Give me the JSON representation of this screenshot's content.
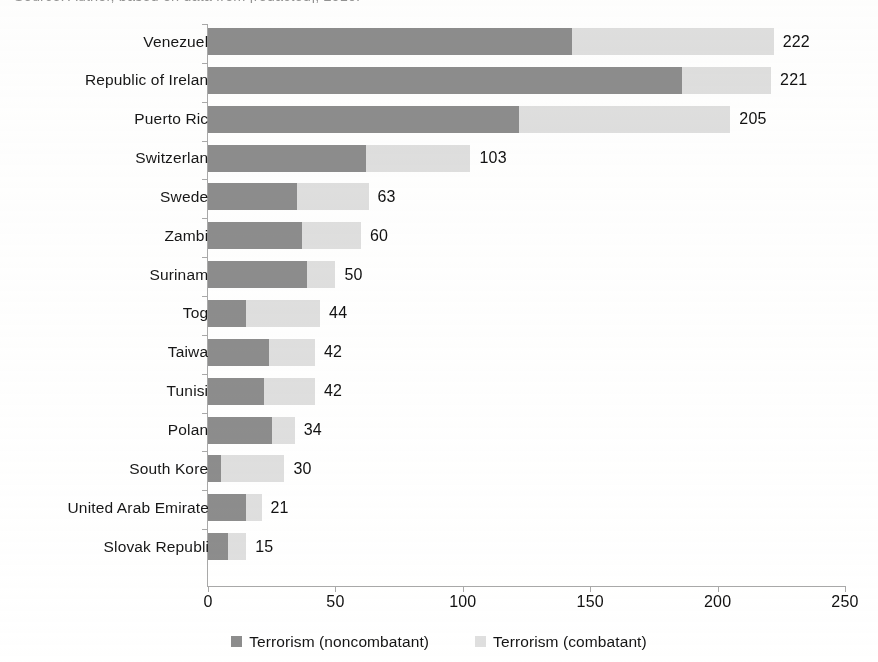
{
  "title_remnant": "Source: Author, based on data from [redacted], 2010.",
  "chart_data": {
    "type": "bar",
    "orientation": "horizontal",
    "stacked": true,
    "title": "",
    "xlabel": "",
    "ylabel": "",
    "xlim": [
      0,
      250
    ],
    "xticks": [
      0,
      50,
      100,
      150,
      200,
      250
    ],
    "xtick_labels": [
      "0",
      "50",
      "100",
      "150",
      "200",
      "250"
    ],
    "grid": false,
    "legend_position": "bottom-center",
    "colors": {
      "noncombatant": "#8d8d8d",
      "combatant": "#dfdfdf",
      "axis": "#a9a9a9",
      "text": "#111111",
      "background": "#ffffff"
    },
    "categories": [
      "Venezuela",
      "Republic of Ireland",
      "Puerto Rico",
      "Switzerland",
      "Sweden",
      "Zambia",
      "Suriname",
      "Togo",
      "Taiwan",
      "Tunisia",
      "Poland",
      "South Korea",
      "United Arab Emirates",
      "Slovak Republic"
    ],
    "series": [
      {
        "name": "Terrorism (noncombatant)",
        "color": "#8d8d8d",
        "values": [
          143,
          186,
          122,
          62,
          35,
          37,
          39,
          15,
          24,
          22,
          25,
          5,
          15,
          8
        ]
      },
      {
        "name": "Terrorism (combatant)",
        "color": "#dfdfdf",
        "values": [
          79,
          35,
          83,
          41,
          28,
          23,
          11,
          29,
          18,
          20,
          9,
          25,
          6,
          7
        ]
      }
    ],
    "totals": [
      222,
      221,
      205,
      103,
      63,
      60,
      50,
      44,
      42,
      42,
      34,
      30,
      21,
      15
    ],
    "total_labels": [
      "222",
      "221",
      "205",
      "103",
      "63",
      "60",
      "50",
      "44",
      "42",
      "42",
      "34",
      "30",
      "21",
      "15"
    ]
  },
  "legend": {
    "items": [
      {
        "label": "Terrorism (noncombatant)",
        "color": "#8d8d8d"
      },
      {
        "label": "Terrorism (combatant)",
        "color": "#dfdfdf"
      }
    ]
  }
}
